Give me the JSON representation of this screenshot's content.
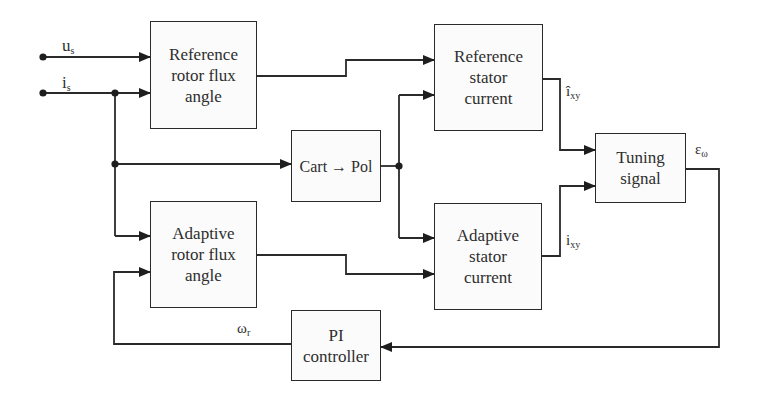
{
  "diagram": {
    "type": "block-diagram",
    "colors": {
      "line": "#2a2a2a",
      "text": "#2e2e2e",
      "background": "#ffffff"
    },
    "inputs": [
      {
        "id": "us",
        "symbol": "u",
        "subscript": "s"
      },
      {
        "id": "is",
        "symbol": "i",
        "subscript": "s"
      }
    ],
    "blocks": {
      "ref_rotor": {
        "label": "Reference\nrotor flux\nangle"
      },
      "ref_stator": {
        "label": "Reference\nstator\ncurrent"
      },
      "cart_pol": {
        "label": "Cart → Pol"
      },
      "tuning": {
        "label": "Tuning\nsignal"
      },
      "adapt_rotor": {
        "label": "Adaptive\nrotor flux\nangle"
      },
      "adapt_stator": {
        "label": "Adaptive\nstator\ncurrent"
      },
      "pi": {
        "label": "PI\ncontroller"
      }
    },
    "signals": {
      "ixy_hat": {
        "symbol": "î",
        "subscript": "xy"
      },
      "ixy": {
        "symbol": "i",
        "subscript": "xy"
      },
      "eps_omega": {
        "symbol": "ε",
        "subscript": "ω"
      },
      "omega_r": {
        "symbol": "ω",
        "subscript": "r"
      }
    },
    "connections": [
      {
        "from": "us",
        "to": "ref_rotor"
      },
      {
        "from": "is",
        "to": "ref_rotor"
      },
      {
        "from": "is",
        "to": "cart_pol"
      },
      {
        "from": "is",
        "to": "adapt_rotor"
      },
      {
        "from": "ref_rotor",
        "to": "ref_stator"
      },
      {
        "from": "cart_pol",
        "to": "ref_stator"
      },
      {
        "from": "cart_pol",
        "to": "adapt_stator"
      },
      {
        "from": "adapt_rotor",
        "to": "adapt_stator"
      },
      {
        "from": "ref_stator",
        "to": "tuning",
        "signal": "ixy_hat"
      },
      {
        "from": "adapt_stator",
        "to": "tuning",
        "signal": "ixy"
      },
      {
        "from": "tuning",
        "to": "pi",
        "signal": "eps_omega"
      },
      {
        "from": "pi",
        "to": "adapt_rotor",
        "signal": "omega_r"
      }
    ]
  }
}
